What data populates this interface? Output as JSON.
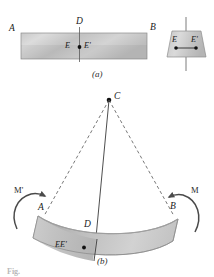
{
  "figure": {
    "caption_a": "(a)",
    "caption_b": "(b)",
    "bottom_caption": "Fig.",
    "panel_a": {
      "name": "straight-beam-panel",
      "labels": {
        "left_end": "A",
        "right_end": "B",
        "top_section": "D",
        "point_e": "E",
        "point_e_prime": "E'"
      },
      "cross_section": {
        "point_e": "E",
        "point_e_prime": "E'"
      }
    },
    "panel_b": {
      "name": "bent-beam-panel",
      "labels": {
        "center_of_curvature": "C",
        "left_end": "A",
        "right_end": "B",
        "section_line": "D",
        "points_ee_prime": "EE'",
        "moment_left": "M'",
        "moment_right": "M"
      }
    },
    "colors": {
      "beam_light": "#d8d8d8",
      "beam_mid": "#b9b9b9",
      "beam_dark": "#9a9a9a",
      "outline": "#6e6e6e",
      "line": "#3a3a3a",
      "dashed": "#555555",
      "text": "#1a1a1a",
      "background": "#ffffff"
    }
  }
}
